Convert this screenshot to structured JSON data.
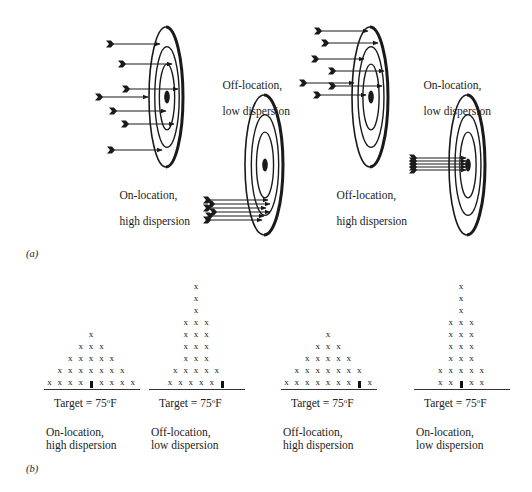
{
  "figure": {
    "panel_a_label": "(a)",
    "panel_b_label": "(b)",
    "colors": {
      "ink": "#1a1a1a",
      "background": "#ffffff"
    }
  },
  "panel_a": {
    "targets": [
      {
        "id": "target-1",
        "caption_line1": "On-location,",
        "caption_line2": "high dispersion",
        "cx": 166,
        "cy": 97,
        "rx": 17,
        "ry": 70,
        "arrows": [
          [
            109,
            44,
            160
          ],
          [
            121,
            64,
            172
          ],
          [
            125,
            89,
            178
          ],
          [
            98,
            97,
            148
          ],
          [
            112,
            111,
            166
          ],
          [
            124,
            124,
            174
          ],
          [
            110,
            150,
            162
          ]
        ]
      },
      {
        "id": "target-2",
        "caption_line1": "Off-location,",
        "caption_line2": "low dispersion",
        "cx": 264,
        "cy": 165,
        "rx": 19,
        "ry": 70,
        "arrows": [
          [
            206,
            200,
            268
          ],
          [
            210,
            204,
            270
          ],
          [
            206,
            208,
            266
          ],
          [
            212,
            212,
            270
          ],
          [
            208,
            216,
            264
          ],
          [
            206,
            220,
            262
          ]
        ]
      },
      {
        "id": "target-3",
        "caption_line1": "Off-location,",
        "caption_line2": "high dispersion",
        "cx": 370,
        "cy": 97,
        "rx": 18,
        "ry": 70,
        "arrows": [
          [
            317,
            31,
            368
          ],
          [
            324,
            43,
            378
          ],
          [
            314,
            59,
            364
          ],
          [
            331,
            71,
            384
          ],
          [
            302,
            83,
            354
          ],
          [
            331,
            86,
            382
          ],
          [
            316,
            95,
            366
          ]
        ]
      },
      {
        "id": "target-4",
        "caption_line1": "On-location,",
        "caption_line2": "low dispersion",
        "cx": 467,
        "cy": 165,
        "rx": 18,
        "ry": 70,
        "arrows": [
          [
            412,
            158,
            466
          ],
          [
            412,
            161,
            466
          ],
          [
            412,
            164,
            466
          ],
          [
            412,
            167,
            466
          ],
          [
            412,
            170,
            466
          ]
        ]
      }
    ]
  },
  "panel_b": {
    "charts": [
      {
        "id": "chart-1",
        "target_text": "Target = 75",
        "target_unit": "F",
        "degree": "o",
        "caption_line1": "On-location,",
        "caption_line2": "high dispersion",
        "rows_bottom_to_top": [
          "x x x x ▮ x x x x",
          "x x x x x x x",
          "x x x x x",
          "x x x",
          "x"
        ]
      },
      {
        "id": "chart-2",
        "target_text": "Target = 75",
        "target_unit": "F",
        "degree": "o",
        "caption_line1": "Off-location,",
        "caption_line2": "low dispersion",
        "rows_bottom_to_top": [
          "x x x x x ▮",
          "x x x x x",
          "x x x",
          "x x x",
          "x x x",
          "x x x",
          "x",
          "x",
          "x"
        ]
      },
      {
        "id": "chart-3",
        "target_text": "Target = 75",
        "target_unit": "F",
        "degree": "o",
        "caption_line1": "Off-location,",
        "caption_line2": "high dispersion",
        "rows_bottom_to_top": [
          "x x x x x x x ▮ x",
          "x x x x x x x",
          "x x x x x",
          "x x x",
          "x"
        ]
      },
      {
        "id": "chart-4",
        "target_text": "Target = 75",
        "target_unit": "F",
        "degree": "o",
        "caption_line1": "On-location,",
        "caption_line2": "low dispersion",
        "rows_bottom_to_top": [
          "x x ▮ x x",
          "x x x x x",
          "x x x",
          "x x x",
          "x x x",
          "x x x",
          "x",
          "x",
          "x"
        ]
      }
    ]
  },
  "chart_data": [
    {
      "type": "scatter",
      "title": "On-location, high dispersion",
      "xlabel": "Target = 75°F",
      "target_position": 4,
      "column_counts": [
        1,
        2,
        3,
        4,
        0,
        4,
        3,
        2,
        1
      ],
      "note": "Dot-plot: 25 x-marks symmetric about target; rows of 9(8 x + target),7,5,3,1"
    },
    {
      "type": "scatter",
      "title": "Off-location, low dispersion",
      "xlabel": "Target = 75°F",
      "target_position": 5,
      "column_counts": [
        2,
        6,
        9,
        6,
        2
      ],
      "note": "Dot-plot: narrow, tall peak left of target; rows 5,5,3,3,3,3,1,1,1"
    },
    {
      "type": "scatter",
      "title": "Off-location, high dispersion",
      "xlabel": "Target = 75°F",
      "target_position": 7,
      "column_counts": [
        1,
        2,
        3,
        4,
        5,
        4,
        3,
        2,
        1
      ],
      "note": "Dot-plot: wide spread centered left of target; rows 9,7,5,3,1"
    },
    {
      "type": "scatter",
      "title": "On-location, low dispersion",
      "xlabel": "Target = 75°F",
      "target_position": 2,
      "column_counts": [
        2,
        6,
        8,
        6,
        2
      ],
      "note": "Dot-plot: narrow, tall peak centered on target; rows 5(4 x + target),5,3,3,3,3,1,1,1"
    }
  ]
}
